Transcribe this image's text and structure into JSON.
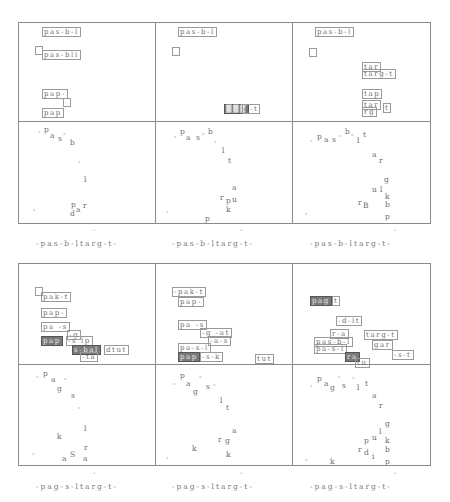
{
  "captions": {
    "top": [
      "-pas-b-ltarg-t-",
      "-pas-b-ltarg-t-",
      "-pas-b-ltarg-t-"
    ],
    "bottom": [
      "-pag-s-ltarg-t-",
      "-pag-s-ltarg-t-",
      "-pag-s-ltarg-t-"
    ]
  },
  "top_panels": [
    {
      "boxes": [
        {
          "text": "pas-b-l",
          "x": 42,
          "y": 27
        },
        {
          "text": "",
          "x": 35,
          "y": 46,
          "square": true
        },
        {
          "text": "pas-bli",
          "x": 42,
          "y": 50
        },
        {
          "text": "pap-",
          "x": 42,
          "y": 89
        },
        {
          "text": "",
          "x": 63,
          "y": 98,
          "square": true
        },
        {
          "text": "pap",
          "x": 42,
          "y": 108
        }
      ]
    },
    {
      "boxes": [
        {
          "text": "pas-b-l",
          "x": 178,
          "y": 27
        },
        {
          "text": "",
          "x": 172,
          "y": 47,
          "square": true
        },
        {
          "text": "▓▓▓",
          "x": 224,
          "y": 104,
          "dark": true
        },
        {
          "text": "g-t",
          "x": 242,
          "y": 104
        }
      ]
    },
    {
      "boxes": [
        {
          "text": "pas-b-l",
          "x": 315,
          "y": 27
        },
        {
          "text": "",
          "x": 309,
          "y": 48,
          "square": true
        },
        {
          "text": "tar",
          "x": 362,
          "y": 62
        },
        {
          "text": "targ-t",
          "x": 362,
          "y": 69
        },
        {
          "text": "tap",
          "x": 362,
          "y": 89
        },
        {
          "text": "tar",
          "x": 362,
          "y": 100
        },
        {
          "text": "rg",
          "x": 362,
          "y": 107
        },
        {
          "text": "t",
          "x": 383,
          "y": 103
        }
      ]
    }
  ],
  "top_chars": [
    [
      {
        "c": "-",
        "x": 38,
        "y": 128
      },
      {
        "c": "p",
        "x": 44,
        "y": 126
      },
      {
        "c": "a",
        "x": 50,
        "y": 132
      },
      {
        "c": "s",
        "x": 58,
        "y": 135
      },
      {
        "c": "-",
        "x": 63,
        "y": 130
      },
      {
        "c": "b",
        "x": 70,
        "y": 139
      },
      {
        "c": "-",
        "x": 78,
        "y": 158
      },
      {
        "c": "l",
        "x": 84,
        "y": 176
      },
      {
        "c": "-",
        "x": 33,
        "y": 206
      },
      {
        "c": "p",
        "x": 71,
        "y": 201
      },
      {
        "c": "a",
        "x": 76,
        "y": 206
      },
      {
        "c": "r",
        "x": 83,
        "y": 202
      },
      {
        "c": "d",
        "x": 70,
        "y": 210
      }
    ],
    [
      {
        "c": "-",
        "x": 174,
        "y": 133
      },
      {
        "c": "p",
        "x": 180,
        "y": 128
      },
      {
        "c": "a",
        "x": 186,
        "y": 134
      },
      {
        "c": "s",
        "x": 196,
        "y": 134
      },
      {
        "c": "-",
        "x": 202,
        "y": 130
      },
      {
        "c": "b",
        "x": 208,
        "y": 128
      },
      {
        "c": "-",
        "x": 214,
        "y": 138
      },
      {
        "c": "l",
        "x": 222,
        "y": 147
      },
      {
        "c": "t",
        "x": 228,
        "y": 157
      },
      {
        "c": "a",
        "x": 232,
        "y": 184
      },
      {
        "c": "r",
        "x": 220,
        "y": 194
      },
      {
        "c": "p",
        "x": 226,
        "y": 197
      },
      {
        "c": "u",
        "x": 232,
        "y": 196
      },
      {
        "c": "k",
        "x": 226,
        "y": 206
      },
      {
        "c": "-",
        "x": 166,
        "y": 208
      },
      {
        "c": "p",
        "x": 205,
        "y": 215
      }
    ],
    [
      {
        "c": "-",
        "x": 310,
        "y": 137
      },
      {
        "c": "p",
        "x": 317,
        "y": 133
      },
      {
        "c": "a",
        "x": 324,
        "y": 136
      },
      {
        "c": "s",
        "x": 332,
        "y": 136
      },
      {
        "c": "-",
        "x": 339,
        "y": 132
      },
      {
        "c": "b",
        "x": 345,
        "y": 128
      },
      {
        "c": "-",
        "x": 351,
        "y": 131
      },
      {
        "c": "l",
        "x": 357,
        "y": 137
      },
      {
        "c": "t",
        "x": 363,
        "y": 131
      },
      {
        "c": "a",
        "x": 372,
        "y": 151
      },
      {
        "c": "r",
        "x": 379,
        "y": 157
      },
      {
        "c": "g",
        "x": 384,
        "y": 176
      },
      {
        "c": "u",
        "x": 372,
        "y": 186
      },
      {
        "c": "l",
        "x": 380,
        "y": 186
      },
      {
        "c": "k",
        "x": 385,
        "y": 193
      },
      {
        "c": "r",
        "x": 358,
        "y": 199
      },
      {
        "c": "B",
        "x": 363,
        "y": 202
      },
      {
        "c": "b",
        "x": 385,
        "y": 201
      },
      {
        "c": "-",
        "x": 305,
        "y": 210
      },
      {
        "c": "p",
        "x": 385,
        "y": 213
      }
    ]
  ],
  "bottom_panels": [
    {
      "boxes": [
        {
          "text": "",
          "x": 35,
          "y": 287,
          "square": true
        },
        {
          "text": "pak-t",
          "x": 41,
          "y": 292
        },
        {
          "text": "pap-",
          "x": 41,
          "y": 308
        },
        {
          "text": "pa -s",
          "x": 41,
          "y": 322
        },
        {
          "text": "-g",
          "x": 67,
          "y": 330
        },
        {
          "text": "pap",
          "x": 41,
          "y": 336,
          "dark": true
        },
        {
          "text": "-s lp",
          "x": 66,
          "y": 336
        },
        {
          "text": "s-bal",
          "x": 72,
          "y": 345,
          "dark": true
        },
        {
          "text": "dtut",
          "x": 104,
          "y": 345
        },
        {
          "text": "-ta",
          "x": 80,
          "y": 352
        }
      ]
    },
    {
      "boxes": [
        {
          "text": "-pak-t",
          "x": 172,
          "y": 287
        },
        {
          "text": "pap-",
          "x": 178,
          "y": 297
        },
        {
          "text": "pa -s",
          "x": 178,
          "y": 320
        },
        {
          "text": "-g -at",
          "x": 200,
          "y": 328
        },
        {
          "text": "-a-s",
          "x": 208,
          "y": 336
        },
        {
          "text": "pa-s-l",
          "x": 178,
          "y": 343
        },
        {
          "text": "pap",
          "x": 178,
          "y": 352,
          "dark": true
        },
        {
          "text": "-s-k",
          "x": 200,
          "y": 352
        },
        {
          "text": "tut",
          "x": 255,
          "y": 354
        }
      ]
    },
    {
      "boxes": [
        {
          "text": "pag",
          "x": 310,
          "y": 296,
          "dark": true
        },
        {
          "text": "t",
          "x": 332,
          "y": 296
        },
        {
          "text": "-d-lt",
          "x": 336,
          "y": 316
        },
        {
          "text": "r-a",
          "x": 330,
          "y": 329
        },
        {
          "text": "targ-t",
          "x": 364,
          "y": 330
        },
        {
          "text": "pas-b-l",
          "x": 314,
          "y": 337
        },
        {
          "text": "pa-s-l",
          "x": 314,
          "y": 344
        },
        {
          "text": "gar",
          "x": 372,
          "y": 340
        },
        {
          "text": "-s-t",
          "x": 392,
          "y": 350
        },
        {
          "text": "ra",
          "x": 345,
          "y": 352,
          "dark": true
        },
        {
          "text": "tu",
          "x": 355,
          "y": 358
        }
      ]
    }
  ],
  "bottom_chars": [
    [
      {
        "c": "-",
        "x": 36,
        "y": 373
      },
      {
        "c": "p",
        "x": 43,
        "y": 370
      },
      {
        "c": "a",
        "x": 51,
        "y": 376
      },
      {
        "c": "-",
        "x": 64,
        "y": 375
      },
      {
        "c": "g",
        "x": 57,
        "y": 385
      },
      {
        "c": "s",
        "x": 71,
        "y": 392
      },
      {
        "c": "-",
        "x": 78,
        "y": 404
      },
      {
        "c": "l",
        "x": 84,
        "y": 425
      },
      {
        "c": "k",
        "x": 57,
        "y": 433
      },
      {
        "c": "r",
        "x": 84,
        "y": 444
      },
      {
        "c": "-",
        "x": 32,
        "y": 450
      },
      {
        "c": "a",
        "x": 62,
        "y": 455
      },
      {
        "c": "S",
        "x": 70,
        "y": 451
      },
      {
        "c": "a",
        "x": 83,
        "y": 455
      }
    ],
    [
      {
        "c": "-",
        "x": 173,
        "y": 380
      },
      {
        "c": "p",
        "x": 180,
        "y": 372
      },
      {
        "c": "a",
        "x": 186,
        "y": 380
      },
      {
        "c": "-",
        "x": 199,
        "y": 373
      },
      {
        "c": "g",
        "x": 193,
        "y": 388
      },
      {
        "c": "s",
        "x": 206,
        "y": 383
      },
      {
        "c": "-",
        "x": 213,
        "y": 381
      },
      {
        "c": "l",
        "x": 220,
        "y": 397
      },
      {
        "c": "t",
        "x": 226,
        "y": 404
      },
      {
        "c": "a",
        "x": 232,
        "y": 427
      },
      {
        "c": "r",
        "x": 218,
        "y": 436
      },
      {
        "c": "g",
        "x": 225,
        "y": 437
      },
      {
        "c": "k",
        "x": 192,
        "y": 445
      },
      {
        "c": "k",
        "x": 226,
        "y": 451
      },
      {
        "c": "-",
        "x": 166,
        "y": 454
      }
    ],
    [
      {
        "c": "-",
        "x": 310,
        "y": 382
      },
      {
        "c": "p",
        "x": 317,
        "y": 375
      },
      {
        "c": "a",
        "x": 324,
        "y": 380
      },
      {
        "c": "g",
        "x": 330,
        "y": 384
      },
      {
        "c": "-",
        "x": 338,
        "y": 373
      },
      {
        "c": "s",
        "x": 342,
        "y": 382
      },
      {
        "c": "-",
        "x": 352,
        "y": 374
      },
      {
        "c": "l",
        "x": 357,
        "y": 384
      },
      {
        "c": "t",
        "x": 365,
        "y": 380
      },
      {
        "c": "a",
        "x": 372,
        "y": 392
      },
      {
        "c": "r",
        "x": 379,
        "y": 402
      },
      {
        "c": "g",
        "x": 385,
        "y": 420
      },
      {
        "c": "l",
        "x": 379,
        "y": 428
      },
      {
        "c": "p",
        "x": 364,
        "y": 437
      },
      {
        "c": "u",
        "x": 372,
        "y": 434
      },
      {
        "c": "k",
        "x": 385,
        "y": 437
      },
      {
        "c": "r",
        "x": 358,
        "y": 446
      },
      {
        "c": "d",
        "x": 364,
        "y": 449
      },
      {
        "c": "i",
        "x": 372,
        "y": 453
      },
      {
        "c": "b",
        "x": 385,
        "y": 446
      },
      {
        "c": "-",
        "x": 305,
        "y": 456
      },
      {
        "c": "k",
        "x": 330,
        "y": 458
      },
      {
        "c": "p",
        "x": 385,
        "y": 458
      }
    ]
  ],
  "ticks": {
    "top": [
      {
        "x": 93,
        "y": 226
      },
      {
        "x": 240,
        "y": 226
      },
      {
        "x": 394,
        "y": 226
      }
    ],
    "bottom": [
      {
        "x": 93,
        "y": 469
      },
      {
        "x": 240,
        "y": 469
      },
      {
        "x": 394,
        "y": 469
      }
    ]
  }
}
